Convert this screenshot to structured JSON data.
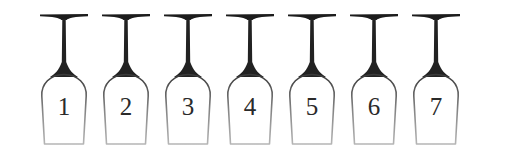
{
  "figure": {
    "background_color": "#ffffff",
    "width": 514,
    "height": 158,
    "orientation": "upside-down",
    "object_count": 7
  },
  "colors": {
    "background": "#ffffff",
    "foot_dark": "#1c1c1c",
    "stem_dark": "#222222",
    "bowl_outline_top": "#3a3a3a",
    "bowl_outline_bottom": "#b5b5b5",
    "numeral": "#2a2a2a"
  },
  "glasses": [
    {
      "label": "1",
      "name": "glass-1",
      "x": 33
    },
    {
      "label": "2",
      "name": "glass-2",
      "x": 95
    },
    {
      "label": "3",
      "name": "glass-3",
      "x": 157
    },
    {
      "label": "4",
      "name": "glass-4",
      "x": 219
    },
    {
      "label": "5",
      "name": "glass-5",
      "x": 281
    },
    {
      "label": "6",
      "name": "glass-6",
      "x": 343
    },
    {
      "label": "7",
      "name": "glass-7",
      "x": 405
    }
  ],
  "geometry": {
    "foot_top_y": 13,
    "foot_width": 48,
    "stem_top_y": 18,
    "stem_bottom_y": 76,
    "stem_width": 4,
    "bowl_top_y": 74,
    "bowl_bottom_y": 144,
    "bowl_width": 46,
    "pitch": 62
  }
}
